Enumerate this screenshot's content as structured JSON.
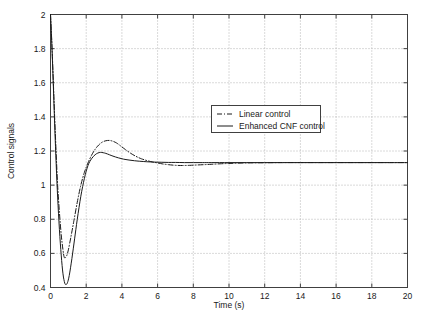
{
  "chart_data": {
    "type": "line",
    "title": "",
    "xlabel": "Time (s)",
    "ylabel": "Control signals",
    "xlim": [
      0,
      20
    ],
    "ylim": [
      0.4,
      2
    ],
    "xticks": [
      0,
      2,
      4,
      6,
      8,
      10,
      12,
      14,
      16,
      18,
      20
    ],
    "xticklabels": [
      "0",
      "2",
      "4",
      "6",
      "8",
      "10",
      "12",
      "14",
      "16",
      "18",
      "20"
    ],
    "yticks": [
      0.4,
      0.6,
      0.8,
      1,
      1.2,
      1.4,
      1.6,
      1.8,
      2
    ],
    "yticklabels": [
      "0.4",
      "0.6",
      "0.8",
      "1",
      "1.2",
      "1.4",
      "1.6",
      "1.8",
      "2"
    ],
    "grid": true,
    "grid_style": "dotted",
    "grid_color": "#b4b4b4",
    "legend_position": "upper-center",
    "series": [
      {
        "name": "Linear control",
        "style": "dash-dot",
        "color": "#1a1a1a",
        "x": [
          0,
          0.08,
          0.16,
          0.24,
          0.32,
          0.4,
          0.5,
          0.6,
          0.7,
          0.78,
          0.9,
          1.0,
          1.15,
          1.3,
          1.5,
          1.7,
          1.9,
          2.1,
          2.3,
          2.5,
          2.7,
          2.9,
          3.1,
          3.3,
          3.5,
          3.7,
          3.9,
          4.2,
          4.5,
          4.8,
          5.1,
          5.4,
          5.7,
          6.0,
          6.3,
          6.6,
          7.0,
          7.4,
          7.8,
          8.2,
          8.6,
          9.0,
          9.5,
          10.0,
          11.0,
          12.0,
          13.0,
          14.0,
          15.0,
          16.0,
          17.0,
          18.0,
          19.0,
          20.0
        ],
        "y": [
          2.0,
          1.82,
          1.6,
          1.38,
          1.18,
          1.0,
          0.84,
          0.71,
          0.62,
          0.575,
          0.585,
          0.62,
          0.7,
          0.785,
          0.9,
          1.0,
          1.075,
          1.13,
          1.175,
          1.21,
          1.235,
          1.252,
          1.26,
          1.262,
          1.257,
          1.247,
          1.232,
          1.208,
          1.186,
          1.168,
          1.154,
          1.144,
          1.136,
          1.13,
          1.124,
          1.12,
          1.116,
          1.115,
          1.116,
          1.118,
          1.12,
          1.122,
          1.125,
          1.127,
          1.13,
          1.131,
          1.132,
          1.132,
          1.132,
          1.132,
          1.132,
          1.132,
          1.132,
          1.132
        ]
      },
      {
        "name": "Enhanced CNF control",
        "style": "solid",
        "color": "#1a1a1a",
        "x": [
          0,
          0.08,
          0.16,
          0.24,
          0.32,
          0.4,
          0.5,
          0.6,
          0.7,
          0.8,
          0.88,
          0.95,
          1.05,
          1.2,
          1.35,
          1.5,
          1.7,
          1.9,
          2.1,
          2.3,
          2.5,
          2.65,
          2.8,
          2.95,
          3.1,
          3.3,
          3.5,
          3.8,
          4.1,
          4.4,
          4.7,
          5.0,
          5.4,
          5.8,
          6.2,
          6.6,
          7.0,
          7.5,
          8.0,
          8.5,
          9.0,
          10.0,
          11.0,
          12.0,
          13.0,
          14.0,
          15.0,
          16.0,
          17.0,
          18.0,
          19.0,
          20.0
        ],
        "y": [
          2.0,
          1.81,
          1.58,
          1.34,
          1.12,
          0.93,
          0.74,
          0.59,
          0.48,
          0.425,
          0.418,
          0.428,
          0.47,
          0.57,
          0.685,
          0.8,
          0.935,
          1.04,
          1.115,
          1.155,
          1.178,
          1.188,
          1.192,
          1.19,
          1.186,
          1.178,
          1.17,
          1.16,
          1.152,
          1.147,
          1.143,
          1.14,
          1.137,
          1.135,
          1.134,
          1.133,
          1.133,
          1.132,
          1.132,
          1.132,
          1.132,
          1.132,
          1.132,
          1.132,
          1.132,
          1.132,
          1.132,
          1.132,
          1.132,
          1.132,
          1.132,
          1.132
        ]
      }
    ]
  },
  "legend": {
    "entries": [
      {
        "label": "Linear control"
      },
      {
        "label": "Enhanced CNF control"
      }
    ]
  }
}
